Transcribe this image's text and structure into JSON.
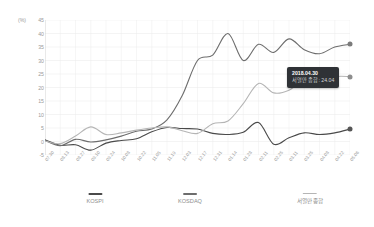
{
  "chart_data": {
    "type": "line",
    "title": "",
    "xlabel": "",
    "ylabel": "(%)",
    "unit_label": "(%)",
    "ylim": [
      -5,
      45
    ],
    "ytick_values": [
      45,
      40,
      35,
      30,
      25,
      20,
      15,
      10,
      5,
      0,
      -5
    ],
    "grid": true,
    "legend_position": "bottom",
    "categories": [
      "07.30",
      "08.13",
      "08.27",
      "09.10",
      "09.24",
      "10.08",
      "10.22",
      "11.05",
      "11.19",
      "12.03",
      "12.17",
      "12.31",
      "01.14",
      "01.28",
      "02.11",
      "02.25",
      "03.11",
      "03.25",
      "04.08",
      "04.22",
      "05.06"
    ],
    "series": [
      {
        "name": "KOSPI",
        "color": "#4a4a4a",
        "values": [
          0.6,
          -1.4,
          -1.2,
          -3.2,
          -0.6,
          0.4,
          1.0,
          3.6,
          5.2,
          4.8,
          4.6,
          3.0,
          2.6,
          3.4,
          7.0,
          -1.0,
          1.4,
          3.2,
          2.6,
          3.2,
          4.6
        ]
      },
      {
        "name": "KOSDAQ",
        "color": "#6d6d6d",
        "values": [
          0.4,
          -1.6,
          0.8,
          -0.2,
          0.6,
          2.0,
          3.8,
          4.6,
          8.0,
          17.0,
          30.0,
          32.0,
          40.0,
          30.0,
          36.0,
          33.0,
          38.0,
          34.0,
          32.5,
          35.0,
          36.0
        ]
      },
      {
        "name": "서열만 종합",
        "color": "#b5b5b5",
        "values": [
          0.2,
          -0.8,
          2.0,
          5.4,
          2.6,
          3.2,
          4.2,
          5.0,
          5.4,
          4.0,
          3.0,
          6.6,
          7.6,
          14.0,
          21.5,
          18.0,
          19.0,
          23.0,
          22.0,
          24.0,
          24.04
        ]
      }
    ],
    "legend": [
      {
        "label": "KOSPI",
        "color": "#4a4a4a"
      },
      {
        "label": "KOSDAQ",
        "color": "#6d6d6d"
      },
      {
        "label": "서열만 종합",
        "color": "#b5b5b5"
      }
    ],
    "tooltip": {
      "date": "2018.04.30",
      "series_label": "서열만 종합",
      "value": "24.04",
      "value_line": "서열만 종합: 24.04"
    },
    "endpoints": [
      {
        "series": "KOSDAQ",
        "value": 36.0,
        "color": "#7b7b7b"
      },
      {
        "series": "서열만 종합",
        "value": 24.04,
        "color": "#8d8d8d"
      },
      {
        "series": "KOSPI",
        "value": 4.6,
        "color": "#555555"
      }
    ]
  }
}
